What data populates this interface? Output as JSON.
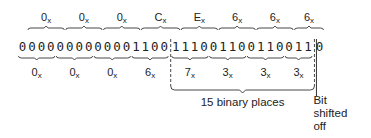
{
  "top_hex": [
    "0",
    "0",
    "0",
    "C",
    "E",
    "6",
    "6",
    "6"
  ],
  "bits": "00000000000011001110011001100110",
  "bottom_hex": [
    "0",
    "0",
    "0",
    "6",
    "7",
    "3",
    "3",
    "3"
  ],
  "hex_suffix": "x",
  "annotation_places": "15 binary places",
  "annotation_shifted": [
    "Bit",
    "shifted",
    "off"
  ],
  "dashed_box_start_bit": 16,
  "shifted_bit_index": 31
}
